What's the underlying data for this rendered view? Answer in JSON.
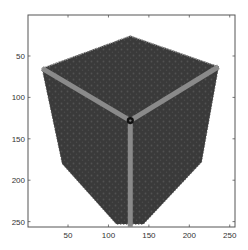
{
  "chart_data": {
    "type": "heatmap",
    "title": "",
    "xlabel": "",
    "ylabel": "",
    "xlim": [
      0.5,
      256.5
    ],
    "ylim": [
      0.5,
      256.5
    ],
    "y_direction": "reverse",
    "grid": false,
    "legend": null,
    "x_ticks": [
      50,
      100,
      150,
      200,
      250
    ],
    "y_ticks": [
      50,
      100,
      150,
      200,
      250
    ],
    "x_tick_labels": [
      "50",
      "100",
      "150",
      "200",
      "250"
    ],
    "y_tick_labels": [
      "50",
      "100",
      "150",
      "200",
      "250"
    ],
    "image_content": {
      "object": "cube",
      "outline_vertices": [
        {
          "name": "top",
          "x": 127,
          "y": 26
        },
        {
          "name": "right-upper",
          "x": 236,
          "y": 63
        },
        {
          "name": "right-lower",
          "x": 215,
          "y": 178
        },
        {
          "name": "bottom-right",
          "x": 143,
          "y": 253
        },
        {
          "name": "bottom-left",
          "x": 110,
          "y": 253
        },
        {
          "name": "left-lower",
          "x": 43,
          "y": 180
        },
        {
          "name": "left-upper",
          "x": 18,
          "y": 65
        }
      ],
      "center_vertex": {
        "x": 127,
        "y": 128
      },
      "edges_from_center": [
        "left-upper",
        "right-upper",
        "bottom"
      ],
      "bottom_edge_end": {
        "x": 127,
        "y": 256
      },
      "fill_color": "#3c3c3c",
      "edge_color": "#8a8a8a",
      "vertex_marker_color": "#111111"
    },
    "colors": {
      "background": "#ffffff",
      "axes": "#555555"
    }
  }
}
